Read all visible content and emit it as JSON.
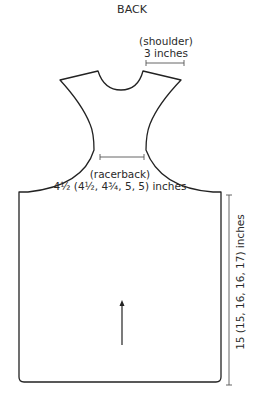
{
  "diagram": {
    "title": "BACK",
    "labels": {
      "shoulder": {
        "name": "(shoulder)",
        "value": "3 inches"
      },
      "racerback": {
        "name": "(racerback)",
        "value": "4½ (4½, 4¾, 5, 5) inches"
      },
      "length": {
        "value": "15 (15, 16, 16, 17) inches"
      }
    },
    "icons": {
      "direction_arrow": "up-arrow-icon"
    },
    "colors": {
      "outline": "#222222",
      "dimension": "#555555"
    }
  }
}
